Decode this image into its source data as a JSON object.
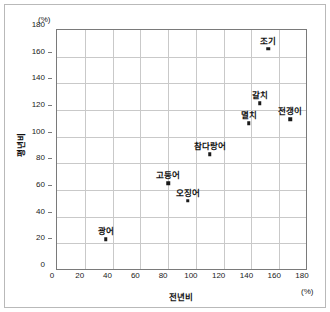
{
  "chart_data": {
    "type": "scatter",
    "title": "",
    "xlabel": "전년비",
    "ylabel": "평년비",
    "x_unit": "(%)",
    "y_unit": "(%)",
    "xlim": [
      0,
      180
    ],
    "ylim": [
      0,
      180
    ],
    "xticks": [
      "0",
      "20",
      "40",
      "60",
      "80",
      "100",
      "120",
      "140",
      "160",
      "180"
    ],
    "yticks": [
      "0",
      "20",
      "40",
      "60",
      "80",
      "100",
      "120",
      "140",
      "160",
      "180"
    ],
    "grid": true,
    "legend": "none",
    "marker_color": "#1a1a1a",
    "points": [
      {
        "label": "광어",
        "x": 35,
        "y": 23
      },
      {
        "label": "고등어",
        "x": 80,
        "y": 65
      },
      {
        "label": "오징어",
        "x": 94,
        "y": 52
      },
      {
        "label": "참다랑어",
        "x": 110,
        "y": 87
      },
      {
        "label": "멸치",
        "x": 138,
        "y": 110
      },
      {
        "label": "갈치",
        "x": 146,
        "y": 125
      },
      {
        "label": "전갱이",
        "x": 168,
        "y": 113
      },
      {
        "label": "조기",
        "x": 152,
        "y": 166
      }
    ]
  }
}
